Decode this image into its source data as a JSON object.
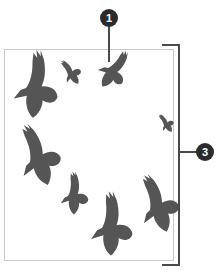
{
  "diagram": {
    "callouts": [
      {
        "id": "1",
        "label": "1",
        "target": "bird-3"
      },
      {
        "id": "3",
        "label": "3",
        "target": "frame-height-bracket"
      }
    ],
    "colors": {
      "bird": "#555555",
      "frame": "#c8c8c8",
      "bracket": "#4a4a4a",
      "callout_fill": "#2b2b2b",
      "callout_text": "#ffffff"
    },
    "bird_count": 8
  }
}
